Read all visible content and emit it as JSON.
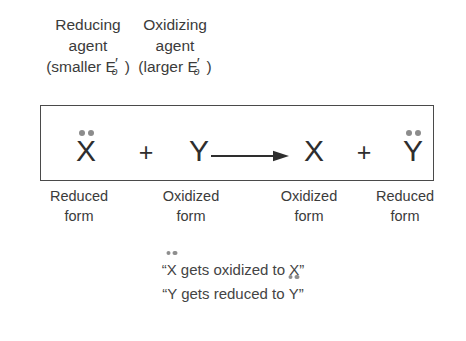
{
  "figure": {
    "background_color": "#ffffff",
    "text_color": "#3b3b3b",
    "dot_color": "#8c8c8c",
    "box_border_color": "#4a4a4a"
  },
  "top_labels": [
    {
      "id": "reducing-agent",
      "line1": "Reducing",
      "line2": "agent",
      "paren_open": "(smaller ",
      "symbol_base": "E",
      "symbol_prime": "′",
      "symbol_subscript": "o",
      "paren_close": ")"
    },
    {
      "id": "oxidizing-agent",
      "line1": "Oxidizing",
      "line2": "agent",
      "paren_open": "(larger ",
      "symbol_base": "E",
      "symbol_prime": "′",
      "symbol_subscript": "o",
      "paren_close": ")"
    }
  ],
  "equation": {
    "reactant_1": "X",
    "reactant_1_electron_pair": true,
    "operator_1": "+",
    "reactant_2": "Y",
    "reactant_2_electron_pair": false,
    "arrow": "reaction-arrow",
    "product_1": "X",
    "product_1_electron_pair": false,
    "operator_2": "+",
    "product_2": "Y",
    "product_2_electron_pair": true
  },
  "form_labels": [
    {
      "line1": "Reduced",
      "line2": "form"
    },
    {
      "line1": "Oxidized",
      "line2": "form"
    },
    {
      "line1": "Oxidized",
      "line2": "form"
    },
    {
      "line1": "Reduced",
      "line2": "form"
    }
  ],
  "statements": [
    {
      "quote_open": "“",
      "subject": "X",
      "subject_has_dots": true,
      "middle": " gets oxidized to ",
      "object": "X",
      "object_has_dots": false,
      "quote_close": "”"
    },
    {
      "quote_open": "“",
      "subject": "Y",
      "subject_has_dots": false,
      "middle": " gets reduced to ",
      "object": "Y",
      "object_has_dots": true,
      "quote_close": "”"
    }
  ]
}
